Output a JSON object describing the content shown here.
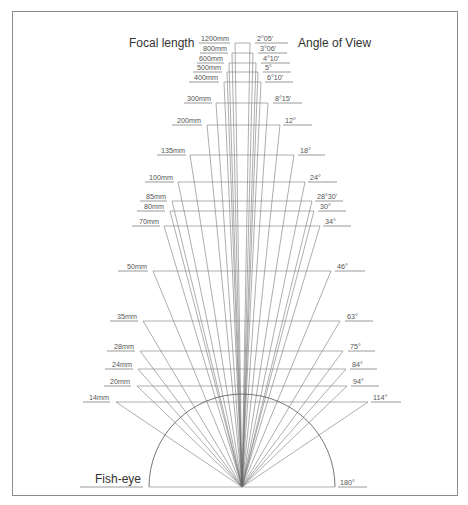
{
  "headers": {
    "left": "Focal length",
    "right": "Angle of View",
    "fisheye": "Fish-eye"
  },
  "vertex": {
    "x": 242,
    "y": 487
  },
  "semicircle": {
    "cx": 242,
    "cy": 487,
    "r": 93
  },
  "chart_data": {
    "type": "table",
    "columns": [
      "Focal length",
      "Angle of View"
    ],
    "rows": [
      {
        "focal": "1200mm",
        "angle": "2°05'",
        "y": 43,
        "xl": 235,
        "xr": 250,
        "lx1": 199,
        "lx2": 230,
        "rx1": 255,
        "rx2": 288
      },
      {
        "focal": "800mm",
        "angle": "3°06'",
        "y": 53,
        "xl": 232,
        "xr": 253,
        "lx1": 200,
        "lx2": 228,
        "rx1": 258,
        "rx2": 287
      },
      {
        "focal": "600mm",
        "angle": "4°10'",
        "y": 63,
        "xl": 229,
        "xr": 256,
        "lx1": 197,
        "lx2": 224,
        "rx1": 261,
        "rx2": 290
      },
      {
        "focal": "500mm",
        "angle": "5°",
        "y": 72,
        "xl": 227,
        "xr": 258,
        "lx1": 193,
        "lx2": 222,
        "rx1": 263,
        "rx2": 291
      },
      {
        "focal": "400mm",
        "angle": "6°10'",
        "y": 82,
        "xl": 224,
        "xr": 261,
        "lx1": 189,
        "lx2": 219,
        "rx1": 265,
        "rx2": 293
      },
      {
        "focal": "300mm",
        "angle": "8°15'",
        "y": 103,
        "xl": 216,
        "xr": 268,
        "lx1": 184,
        "lx2": 212,
        "rx1": 273,
        "rx2": 302
      },
      {
        "focal": "200mm",
        "angle": "12°",
        "y": 125,
        "xl": 207,
        "xr": 280,
        "lx1": 172,
        "lx2": 202,
        "rx1": 283,
        "rx2": 312
      },
      {
        "focal": "135mm",
        "angle": "18°",
        "y": 155,
        "xl": 190,
        "xr": 294,
        "lx1": 157,
        "lx2": 186,
        "rx1": 298,
        "rx2": 325
      },
      {
        "focal": "100mm",
        "angle": "24°",
        "y": 182,
        "xl": 178,
        "xr": 305,
        "lx1": 145,
        "lx2": 174,
        "rx1": 308,
        "rx2": 337
      },
      {
        "focal": "85mm",
        "angle": "28°30'",
        "y": 201,
        "xl": 172,
        "xr": 312,
        "lx1": 140,
        "lx2": 167,
        "rx1": 315,
        "rx2": 343
      },
      {
        "focal": "80mm",
        "angle": "30°",
        "y": 211,
        "xl": 170,
        "xr": 314,
        "lx1": 137,
        "lx2": 165,
        "rx1": 318,
        "rx2": 346
      },
      {
        "focal": "70mm",
        "angle": "34°",
        "y": 226,
        "xl": 164,
        "xr": 320,
        "lx1": 132,
        "lx2": 160,
        "rx1": 323,
        "rx2": 351
      },
      {
        "focal": "50mm",
        "angle": "46°",
        "y": 271,
        "xl": 153,
        "xr": 331,
        "lx1": 118,
        "lx2": 148,
        "rx1": 335,
        "rx2": 365
      },
      {
        "focal": "35mm",
        "angle": "63°",
        "y": 321,
        "xl": 143,
        "xr": 340,
        "lx1": 110,
        "lx2": 138,
        "rx1": 345,
        "rx2": 373
      },
      {
        "focal": "28mm",
        "angle": "75°",
        "y": 351,
        "xl": 140,
        "xr": 343,
        "lx1": 107,
        "lx2": 135,
        "rx1": 348,
        "rx2": 375
      },
      {
        "focal": "24mm",
        "angle": "84°",
        "y": 369,
        "xl": 138,
        "xr": 346,
        "lx1": 105,
        "lx2": 133,
        "rx1": 350,
        "rx2": 377
      },
      {
        "focal": "20mm",
        "angle": "94°",
        "y": 386,
        "xl": 137,
        "xr": 347,
        "lx1": 104,
        "lx2": 131,
        "rx1": 351,
        "rx2": 379
      },
      {
        "focal": "14mm",
        "angle": "114°",
        "y": 402,
        "xl": 116,
        "xr": 368,
        "lx1": 83,
        "lx2": 110,
        "rx1": 371,
        "rx2": 401
      },
      {
        "focal": "Fish-eye",
        "angle": "180°",
        "y": 487,
        "xl": 149,
        "xr": 335,
        "lx1": 80,
        "lx2": 143,
        "rx1": 338,
        "rx2": 367
      }
    ]
  }
}
